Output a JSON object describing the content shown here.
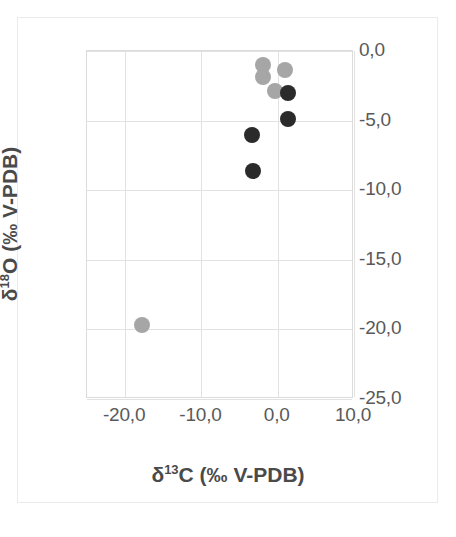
{
  "chart_data": {
    "type": "scatter",
    "title": "",
    "xlabel": "δ¹³C (‰ V-PDB)",
    "ylabel": "δ¹⁸O (‰ V-PDB)",
    "xlim": [
      -25,
      10
    ],
    "ylim": [
      -25,
      0
    ],
    "xticks": [
      -20,
      -10,
      0,
      10
    ],
    "yticks": [
      0,
      -5,
      -10,
      -15,
      -20,
      -25
    ],
    "xtick_labels": [
      "-20,0",
      "-10,0",
      "0,0",
      "10,0"
    ],
    "ytick_labels": [
      "0,0",
      "-5,0",
      "-10,0",
      "-15,0",
      "-20,0",
      "-25,0"
    ],
    "grid": true,
    "legend": "none",
    "y_axis_side": "right",
    "decimal_separator": ",",
    "series": [
      {
        "name": "gray-series",
        "color": "#a6a6a6",
        "marker": "circle",
        "marker_size": 16,
        "points": [
          {
            "x": -1.9,
            "y": -1.0
          },
          {
            "x": -1.9,
            "y": -1.9
          },
          {
            "x": 1.0,
            "y": -1.4
          },
          {
            "x": -0.4,
            "y": -2.9
          },
          {
            "x": -17.8,
            "y": -19.7
          }
        ]
      },
      {
        "name": "dark-series",
        "color": "#2b2b2b",
        "marker": "circle",
        "marker_size": 16,
        "points": [
          {
            "x": 1.4,
            "y": -3.0
          },
          {
            "x": 1.3,
            "y": -4.9
          },
          {
            "x": -3.4,
            "y": -6.0
          },
          {
            "x": -3.2,
            "y": -8.6
          }
        ]
      }
    ]
  },
  "axis": {
    "x_title": "δ¹³C (‰ V-PDB)",
    "y_title": "δ¹⁸O (‰ V-PDB)",
    "x_title_parts": {
      "delta": "δ",
      "sup": "13",
      "rest": "C (‰ V-PDB)"
    },
    "y_title_parts": {
      "delta": "δ",
      "sup": "18",
      "rest": "O (‰ V-PDB)"
    }
  },
  "colors": {
    "gray_marker": "#a6a6a6",
    "dark_marker": "#2b2b2b",
    "gridline": "#e2e2e2",
    "plot_border": "#dcdcdc",
    "outer_border": "#ebebeb",
    "tick_text": "#595959",
    "title_text": "#4a4a4a",
    "background": "#ffffff"
  }
}
